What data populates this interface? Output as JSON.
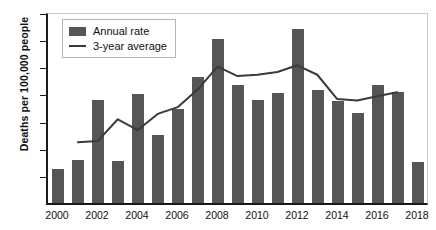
{
  "chart_data": {
    "type": "bar",
    "title": "",
    "subtitle": "",
    "xlabel": "",
    "ylabel": "Deaths per 100,000 people",
    "ylim": [
      0,
      14
    ],
    "yticks": [
      0,
      2,
      4,
      6,
      8,
      10,
      12,
      14
    ],
    "xticks_labeled": [
      "2000",
      "2002",
      "2004",
      "2006",
      "2008",
      "2010",
      "2012",
      "2014",
      "2016",
      "2018"
    ],
    "grid": false,
    "legend_position": "top-left",
    "legend": [
      "Annual rate",
      "3-year average"
    ],
    "categories": [
      "2000",
      "2001",
      "2002",
      "2003",
      "2004",
      "2005",
      "2006",
      "2007",
      "2008",
      "2009",
      "2010",
      "2011",
      "2012",
      "2013",
      "2014",
      "2015",
      "2016",
      "2017",
      "2018"
    ],
    "values": [
      2.5,
      3.2,
      7.6,
      3.1,
      8.0,
      5.0,
      6.9,
      9.3,
      12.1,
      8.7,
      7.6,
      8.1,
      12.8,
      8.3,
      7.5,
      6.6,
      8.7,
      8.2,
      3.0
    ],
    "series": [
      {
        "name": "Annual rate",
        "type": "bar",
        "color": "#565656",
        "x": [
          "2000",
          "2001",
          "2002",
          "2003",
          "2004",
          "2005",
          "2006",
          "2007",
          "2008",
          "2009",
          "2010",
          "2011",
          "2012",
          "2013",
          "2014",
          "2015",
          "2016",
          "2017",
          "2018"
        ],
        "values": [
          2.5,
          3.2,
          7.6,
          3.1,
          8.0,
          5.0,
          6.9,
          9.3,
          12.1,
          8.7,
          7.6,
          8.1,
          12.8,
          8.3,
          7.5,
          6.6,
          8.7,
          8.2,
          3.0
        ]
      },
      {
        "name": "3-year average",
        "type": "line",
        "color": "#3a3a3a",
        "x": [
          "2001",
          "2002",
          "2003",
          "2004",
          "2005",
          "2006",
          "2007",
          "2008",
          "2009",
          "2010",
          "2011",
          "2012",
          "2013",
          "2014",
          "2015",
          "2016",
          "2017"
        ],
        "values": [
          4.5,
          4.6,
          6.2,
          5.4,
          6.6,
          7.1,
          8.4,
          10.1,
          9.4,
          9.5,
          9.7,
          10.2,
          9.5,
          7.7,
          7.6,
          7.9,
          8.2
        ]
      }
    ]
  },
  "axes": {
    "y_title": "Deaths per 100,000 people",
    "y_tick_labels": [
      "14",
      "12",
      "10",
      "8",
      "6",
      "4",
      "2",
      "0"
    ],
    "x_tick_labels": [
      "2000",
      "2002",
      "2004",
      "2006",
      "2008",
      "2010",
      "2012",
      "2014",
      "2016",
      "2018"
    ]
  },
  "legend": {
    "bar_label": "Annual rate",
    "line_label": "3-year average"
  },
  "colors": {
    "bar": "#565656",
    "line": "#3a3a3a",
    "axis": "#1a1a1a",
    "frame": "#c9c9c9",
    "text": "#111111",
    "background": "#ffffff"
  }
}
